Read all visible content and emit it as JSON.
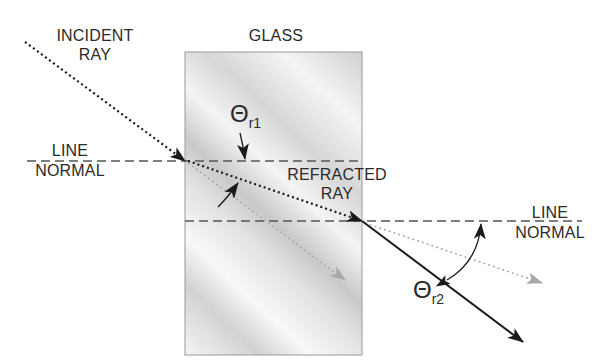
{
  "diagram": {
    "labels": {
      "incident_line1": "INCIDENT",
      "incident_line2": "RAY",
      "glass": "GLASS",
      "normal_left_line1": "LINE",
      "normal_left_line2": "NORMAL",
      "refracted_line1": "REFRACTED",
      "refracted_line2": "RAY",
      "normal_right_line1": "LINE",
      "normal_right_line2": "NORMAL",
      "theta_symbol": "Θ",
      "theta1_sub": "r1",
      "theta2_sub": "r2"
    },
    "colors": {
      "ink": "#1a1a1a",
      "dashed_normal": "#555555",
      "ghost_ray": "#a8a8a8",
      "glass_border": "#9a9a9a",
      "glass_light": "#f7f7f7",
      "glass_dark": "#cfcfcf"
    }
  }
}
